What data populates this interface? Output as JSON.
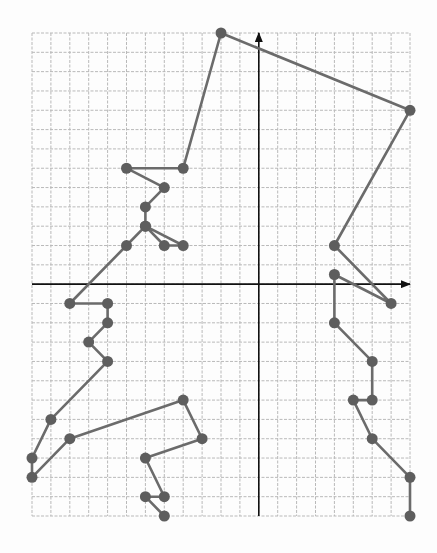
{
  "chart_data": {
    "type": "line",
    "title": "",
    "xlabel": "",
    "ylabel": "",
    "grid": true,
    "legend": null,
    "xlim": [
      -12,
      8
    ],
    "ylim": [
      -12,
      13
    ],
    "grid_step": 1,
    "series": [
      {
        "name": "path",
        "marker": "circle",
        "points": [
          [
            -5,
            -12
          ],
          [
            -6,
            -11
          ],
          [
            -5,
            -11
          ],
          [
            -6,
            -9
          ],
          [
            -3,
            -8
          ],
          [
            -4,
            -6
          ],
          [
            -10,
            -8
          ],
          [
            -12,
            -10
          ],
          [
            -12,
            -9
          ],
          [
            -11,
            -7
          ],
          [
            -8,
            -4
          ],
          [
            -9,
            -3
          ],
          [
            -8,
            -2
          ],
          [
            -8,
            -1
          ],
          [
            -10,
            -1
          ],
          [
            -7,
            2
          ],
          [
            -6,
            3
          ],
          [
            -5,
            2
          ],
          [
            -4,
            2
          ],
          [
            -6,
            3
          ],
          [
            -6,
            4
          ],
          [
            -5,
            5
          ],
          [
            -7,
            6
          ],
          [
            -4,
            6
          ],
          [
            -2,
            13
          ],
          [
            8,
            9
          ],
          [
            4,
            2
          ],
          [
            7,
            -1
          ],
          [
            4,
            0.5
          ],
          [
            4,
            -2
          ],
          [
            6,
            -4
          ],
          [
            6,
            -6
          ],
          [
            5,
            -6
          ],
          [
            6,
            -8
          ],
          [
            8,
            -10
          ],
          [
            8,
            -12
          ]
        ]
      }
    ]
  },
  "colors": {
    "line": "#6b6b6b",
    "marker": "#5e5e5e",
    "grid": "#b9b9b9",
    "axis": "#111111",
    "background": "#fdfdfd"
  }
}
